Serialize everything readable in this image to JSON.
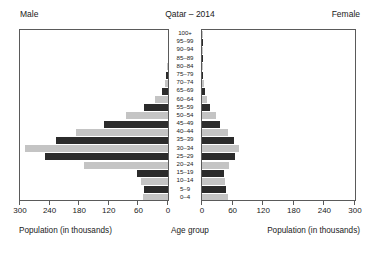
{
  "header": {
    "left_label": "Male",
    "title": "Qatar – 2014",
    "right_label": "Female"
  },
  "axis_titles": {
    "left": "Population (in thousands)",
    "center": "Age group",
    "right": "Population (in thousands)"
  },
  "chart_data": {
    "type": "bar",
    "subtype": "population-pyramid",
    "title": "Qatar – 2014",
    "xlabel": "Population (in thousands)",
    "ylabel": "Age group",
    "xlim_left": [
      300,
      0
    ],
    "xlim_right": [
      0,
      300
    ],
    "grid": false,
    "legend": false,
    "bar_colors": {
      "dark": "#2b2b2b",
      "light": "#c4c4c4"
    },
    "left_ticks": [
      300,
      240,
      180,
      120,
      60,
      0
    ],
    "right_ticks": [
      0,
      60,
      120,
      180,
      240,
      300
    ],
    "categories": [
      "100+",
      "95–99",
      "90–94",
      "85–89",
      "80–84",
      "75–79",
      "70–74",
      "65–69",
      "60–64",
      "55–59",
      "50–54",
      "45–49",
      "40–44",
      "35–39",
      "30–34",
      "25–29",
      "20–24",
      "15–19",
      "10–14",
      "5–9",
      "0–4"
    ],
    "series": [
      {
        "name": "Male",
        "side": "left",
        "values": [
          0.2,
          0.3,
          0.5,
          1.0,
          2.0,
          4.0,
          7.0,
          13.0,
          26.0,
          48.0,
          85.0,
          130.0,
          186.0,
          228.0,
          290.0,
          250.0,
          170.0,
          62.0,
          55.0,
          48.0,
          50.0
        ]
      },
      {
        "name": "Female",
        "side": "right",
        "values": [
          0.2,
          0.3,
          0.4,
          0.8,
          1.4,
          2.2,
          4.0,
          6.0,
          10.0,
          16.0,
          27.0,
          36.0,
          50.0,
          62.0,
          73.0,
          65.0,
          52.0,
          44.0,
          46.0,
          47.0,
          50.0
        ]
      }
    ]
  }
}
